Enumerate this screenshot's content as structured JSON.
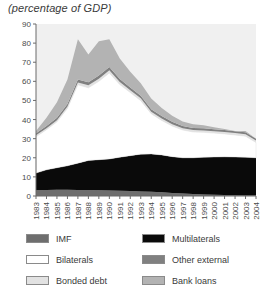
{
  "chart_data": {
    "type": "area",
    "stacked": true,
    "title": "(percentage of GDP)",
    "xlabel": "",
    "ylabel": "",
    "ylim": [
      0,
      90
    ],
    "ytick_step": 10,
    "yticks": [
      0,
      10,
      20,
      30,
      40,
      50,
      60,
      70,
      80,
      90
    ],
    "grid": false,
    "legend_position": "bottom",
    "plot_background": "#f0f0f0",
    "categories": [
      "1983",
      "1984",
      "1985",
      "1986",
      "1987",
      "1988",
      "1989",
      "1990",
      "1991",
      "1992",
      "1993",
      "1994",
      "1995",
      "1996",
      "1997",
      "1998",
      "1999",
      "2000",
      "2001",
      "2002",
      "2003",
      "2004"
    ],
    "series": [
      {
        "name": "IMF",
        "color": "#6e6e6e",
        "values": [
          3.0,
          3.2,
          3.3,
          3.3,
          3.2,
          3.1,
          3.0,
          2.9,
          2.8,
          2.6,
          2.4,
          2.2,
          2.0,
          1.6,
          1.3,
          1.0,
          0.8,
          0.6,
          0.5,
          0.4,
          0.3,
          0.2
        ]
      },
      {
        "name": "Multilaterals",
        "color": "#0a0a0a",
        "values": [
          9.0,
          10.5,
          11.5,
          12.5,
          14.0,
          15.5,
          16.0,
          16.5,
          17.5,
          18.5,
          19.5,
          19.8,
          19.5,
          19.0,
          18.7,
          19.0,
          19.5,
          19.8,
          20.0,
          20.0,
          20.0,
          19.8
        ]
      },
      {
        "name": "Bilaterals",
        "color": "#ffffff",
        "values": [
          19.0,
          21.0,
          24.0,
          30.0,
          41.0,
          38.0,
          41.0,
          45.0,
          38.0,
          33.0,
          28.0,
          21.0,
          18.0,
          16.0,
          14.5,
          13.5,
          13.0,
          12.5,
          12.0,
          11.5,
          11.0,
          8.0
        ]
      },
      {
        "name": "Bonded debt",
        "color": "#e2e2e2",
        "values": [
          0.8,
          0.8,
          0.9,
          1.0,
          1.2,
          1.3,
          1.4,
          1.4,
          1.3,
          1.2,
          1.2,
          1.1,
          1.1,
          1.0,
          1.0,
          1.0,
          1.0,
          1.0,
          1.0,
          1.0,
          1.0,
          1.0
        ]
      },
      {
        "name": "Other external",
        "color": "#808080",
        "values": [
          1.0,
          1.1,
          1.2,
          1.3,
          1.5,
          1.6,
          1.7,
          1.7,
          1.6,
          1.5,
          1.4,
          1.3,
          1.2,
          1.2,
          1.1,
          1.1,
          1.1,
          1.0,
          1.0,
          1.0,
          1.0,
          1.0
        ]
      },
      {
        "name": "Bank loans",
        "color": "#b3b3b3",
        "values": [
          1.2,
          4.4,
          8.1,
          12.9,
          21.1,
          14.5,
          17.9,
          14.5,
          10.8,
          8.2,
          6.5,
          5.6,
          4.2,
          3.2,
          2.4,
          1.9,
          1.6,
          1.1,
          0.5,
          0.1,
          0.7,
          0.0
        ]
      }
    ],
    "totals": [
      34.0,
      41.0,
      49.0,
      61.0,
      82.0,
      74.0,
      81.0,
      82.0,
      72.0,
      65.0,
      59.0,
      51.0,
      46.0,
      42.0,
      39.0,
      37.5,
      37.0,
      36.0,
      35.0,
      34.0,
      34.0,
      30.0
    ]
  },
  "legend": {
    "items": [
      {
        "label": "IMF",
        "color": "#6e6e6e"
      },
      {
        "label": "Multilaterals",
        "color": "#0a0a0a"
      },
      {
        "label": "Bilaterals",
        "color": "#ffffff"
      },
      {
        "label": "Other external",
        "color": "#808080"
      },
      {
        "label": "Bonded debt",
        "color": "#e2e2e2"
      },
      {
        "label": "Bank loans",
        "color": "#b3b3b3"
      }
    ]
  }
}
